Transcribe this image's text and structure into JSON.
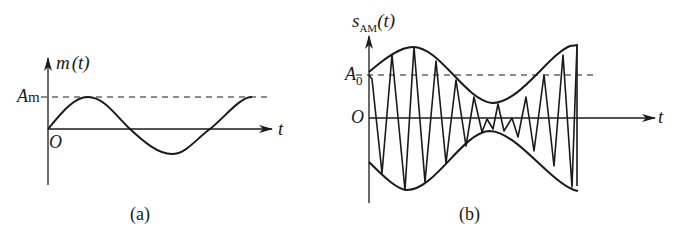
{
  "panel_a": {
    "y_label_func": "m",
    "y_label_arg": "(t)",
    "x_label": "t",
    "origin": "O",
    "amp_label_main": "A",
    "amp_label_sub": "m",
    "caption": "(a)"
  },
  "panel_b": {
    "y_label_main": "s",
    "y_label_sub": "AM",
    "y_label_arg": "(t)",
    "x_label": "t",
    "origin": "O",
    "amp_label_main": "A",
    "amp_label_sub": "0",
    "caption": "(b)"
  },
  "colors": {
    "line": "#1a1a1a",
    "background": "#ffffff"
  }
}
